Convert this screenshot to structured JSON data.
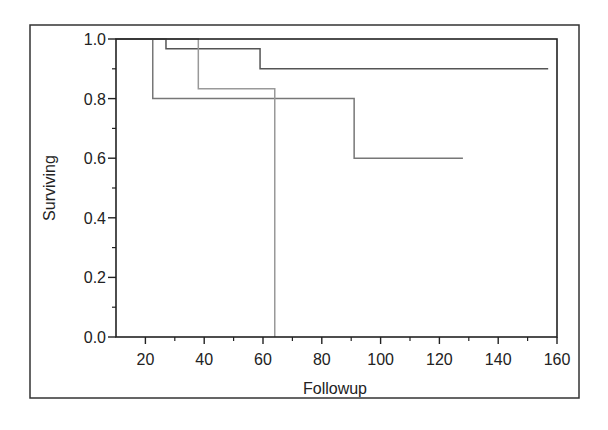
{
  "chart_data": {
    "type": "line",
    "subtype": "kaplan-meier-step",
    "title": "",
    "xlabel": "Followup",
    "ylabel": "Surviving",
    "xlim": [
      10,
      160
    ],
    "ylim": [
      0.0,
      1.0
    ],
    "x_ticks": [
      20,
      40,
      60,
      80,
      100,
      120,
      140,
      160
    ],
    "x_tick_labels": [
      "20",
      "40",
      "60",
      "80",
      "100",
      "120",
      "140",
      "160"
    ],
    "x_minor_ticks": [
      30,
      50,
      70,
      90,
      110,
      130,
      150
    ],
    "y_ticks": [
      0.0,
      0.2,
      0.4,
      0.6,
      0.8,
      1.0
    ],
    "y_tick_labels": [
      "0.0",
      "0.2",
      "0.4",
      "0.6",
      "0.8",
      "1.0"
    ],
    "y_minor_ticks": [
      0.1,
      0.3,
      0.5,
      0.7,
      0.9
    ],
    "grid": false,
    "legend": null,
    "series": [
      {
        "name": "group-1",
        "color": "#555555",
        "steps": [
          [
            10,
            1.0
          ],
          [
            27,
            0.967
          ],
          [
            59,
            0.9
          ],
          [
            157,
            0.9
          ]
        ]
      },
      {
        "name": "group-2",
        "color": "#777777",
        "steps": [
          [
            10,
            1.0
          ],
          [
            22.5,
            0.8
          ],
          [
            91,
            0.6
          ],
          [
            128,
            0.6
          ]
        ]
      },
      {
        "name": "group-3",
        "color": "#999999",
        "steps": [
          [
            10,
            1.0
          ],
          [
            38,
            0.833
          ],
          [
            64,
            0.0
          ]
        ]
      }
    ]
  }
}
